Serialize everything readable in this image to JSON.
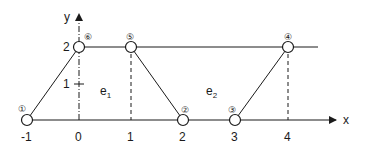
{
  "diagram": {
    "type": "finite-element mesh sketch",
    "axes": {
      "x_label": "x",
      "y_label": "y",
      "x_ticks": [
        "-1",
        "0",
        "1",
        "2",
        "3",
        "4"
      ],
      "y_ticks": [
        "1",
        "2"
      ]
    },
    "nodes": [
      {
        "id": "1",
        "label": "①",
        "x": -1,
        "y": 0
      },
      {
        "id": "2",
        "label": "②",
        "x": 2,
        "y": 0
      },
      {
        "id": "3",
        "label": "③",
        "x": 3,
        "y": 0
      },
      {
        "id": "4",
        "label": "④",
        "x": 4,
        "y": 2
      },
      {
        "id": "5",
        "label": "⑤",
        "x": 1,
        "y": 2
      },
      {
        "id": "6",
        "label": "⑥",
        "x": 0,
        "y": 2
      }
    ],
    "elements": [
      {
        "id": "e1",
        "label": "e",
        "sub": "1"
      },
      {
        "id": "e2",
        "label": "e",
        "sub": "2"
      }
    ],
    "colors": {
      "stroke": "#1a1a1a",
      "background": "#ffffff"
    }
  }
}
